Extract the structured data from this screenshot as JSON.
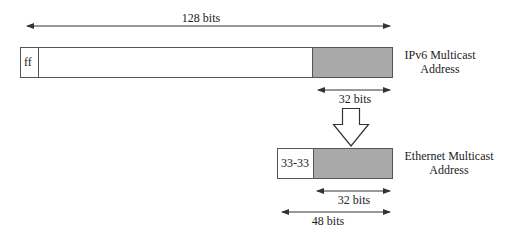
{
  "diagram": {
    "ipv6": {
      "width_label": "128 bits",
      "prefix_label": "ff",
      "name_line1": "IPv6 Multicast",
      "name_line2": "Address",
      "low_bits_label": "32 bits"
    },
    "ethernet": {
      "prefix_label": "33-33",
      "name_line1": "Ethernet Multicast",
      "name_line2": "Address",
      "low_bits_label": "32 bits",
      "width_label": "48 bits"
    },
    "colors": {
      "shaded_field": "#a9a9a9",
      "line": "#333333"
    }
  }
}
